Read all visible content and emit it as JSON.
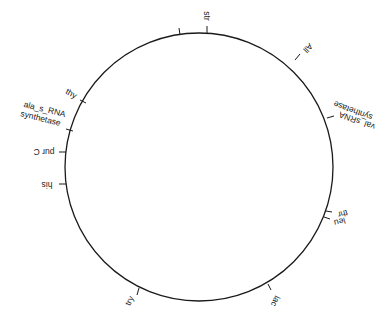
{
  "diagram": {
    "type": "circular genetic map",
    "ring": {
      "cx": 199,
      "cy": 167,
      "r": 134,
      "color": "#1a1a1a"
    },
    "markers": [
      {
        "id": "str",
        "label": "str"
      },
      {
        "id": "unlabeled",
        "label": ""
      },
      {
        "id": "all",
        "label": "All"
      },
      {
        "id": "val",
        "label_line1": "val_sRNA",
        "label_line2": "synthetase"
      },
      {
        "id": "thr",
        "label": "thr"
      },
      {
        "id": "leu",
        "label": "leu"
      },
      {
        "id": "lac",
        "label": "lac"
      },
      {
        "id": "try",
        "label": "try"
      },
      {
        "id": "his",
        "label": "his"
      },
      {
        "id": "purc",
        "label": "pur C"
      },
      {
        "id": "ala",
        "label_line1": "ala_s_RNA",
        "label_line2": "synthetase"
      },
      {
        "id": "thy",
        "label": "thy"
      }
    ]
  }
}
